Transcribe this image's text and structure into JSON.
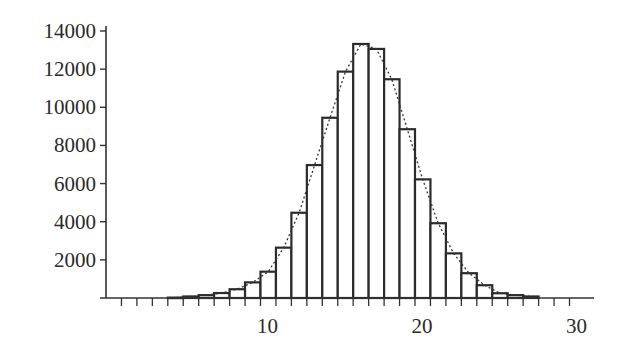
{
  "chart_data": {
    "type": "bar",
    "subtype": "histogram_with_density_curve",
    "title": "",
    "xlabel": "",
    "ylabel": "",
    "xlim": [
      0,
      31
    ],
    "ylim": [
      0,
      14000
    ],
    "grid": false,
    "legend": null,
    "x_ticks": [
      10,
      20,
      30
    ],
    "x_minor_tick_step": 1,
    "y_ticks": [
      2000,
      4000,
      6000,
      8000,
      10000,
      12000,
      14000
    ],
    "bin_width": 1,
    "bins_left_edges": [
      4,
      5,
      6,
      7,
      8,
      9,
      10,
      11,
      12,
      13,
      14,
      15,
      16,
      17,
      18,
      19,
      20,
      21,
      22,
      23,
      24,
      25,
      26,
      27
    ],
    "values": [
      20,
      80,
      150,
      260,
      460,
      820,
      1380,
      2640,
      4470,
      6970,
      9450,
      11870,
      13320,
      13060,
      11470,
      8850,
      6220,
      3920,
      2340,
      1300,
      670,
      250,
      150,
      80
    ],
    "series": [
      {
        "name": "histogram",
        "style": "bars, black outline, white fill"
      },
      {
        "name": "density curve",
        "style": "dotted line through bar midpoints"
      }
    ],
    "colors": {
      "bar_stroke": "#2b2b2b",
      "bar_fill": "#ffffff",
      "axis": "#333333",
      "curve": "#333333"
    }
  }
}
